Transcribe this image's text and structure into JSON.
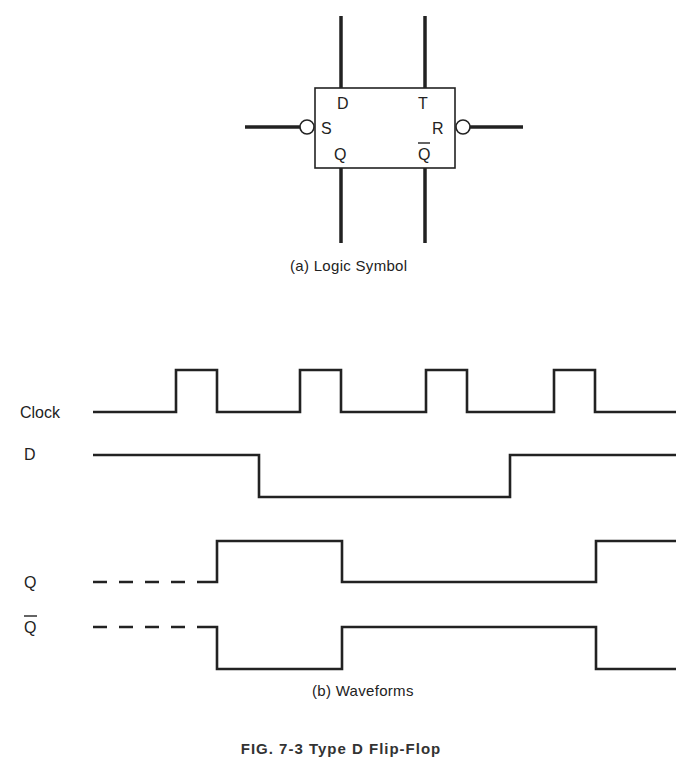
{
  "logic_symbol": {
    "pins": {
      "top_left": "D",
      "top_right": "T",
      "left": "S",
      "right": "R",
      "bottom_left": "Q",
      "bottom_right": "Q"
    },
    "caption": "(a)  Logic Symbol"
  },
  "waveforms": {
    "signals": [
      {
        "name": "Clock",
        "overbar": false
      },
      {
        "name": "D",
        "overbar": false
      },
      {
        "name": "Q",
        "overbar": false
      },
      {
        "name": "Q",
        "overbar": true
      }
    ],
    "caption": "(b)  Waveforms"
  },
  "figure_caption": "FIG. 7-3  Type D Flip-Flop"
}
